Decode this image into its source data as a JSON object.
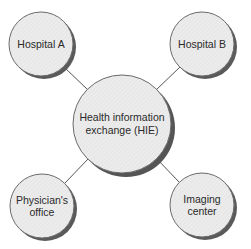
{
  "diagram": {
    "type": "hub-and-spoke",
    "colors": {
      "fill": "#e9e9e9",
      "stroke": "#6a6a6a",
      "shadow": "#555555",
      "connector": "#555555",
      "text": "#2a2a2a"
    },
    "hub": {
      "label": "Health information\nexchange (HIE)",
      "cx": 122,
      "cy": 124,
      "r": 49
    },
    "nodes": [
      {
        "id": "hospital-a",
        "label": "Hospital A",
        "cx": 41,
        "cy": 44,
        "r": 32
      },
      {
        "id": "hospital-b",
        "label": "Hospital B",
        "cx": 202,
        "cy": 44,
        "r": 32
      },
      {
        "id": "physicians-office",
        "label": "Physician's\noffice",
        "cx": 42,
        "cy": 206,
        "r": 32
      },
      {
        "id": "imaging-center",
        "label": "Imaging\ncenter",
        "cx": 202,
        "cy": 205,
        "r": 32
      }
    ],
    "edges": [
      {
        "from": "hospital-a",
        "to": "hub"
      },
      {
        "from": "hospital-b",
        "to": "hub"
      },
      {
        "from": "physicians-office",
        "to": "hub"
      },
      {
        "from": "imaging-center",
        "to": "hub"
      }
    ]
  }
}
